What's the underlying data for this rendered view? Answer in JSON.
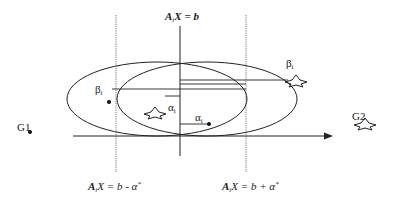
{
  "diagram": {
    "labels": {
      "top_eq": {
        "A": "A",
        "sub": "i",
        "rest": "X = b"
      },
      "left_eq": {
        "A": "A",
        "sub": "i",
        "rest": "X = b - α",
        "sup": "*"
      },
      "right_eq": {
        "A": "A",
        "sub": "i",
        "rest": "X = b + α",
        "sup": "*"
      },
      "beta_left": {
        "sym": "β",
        "sub": "i"
      },
      "beta_right": {
        "sym": "β",
        "sub": "i"
      },
      "alpha_star": {
        "sym": "α",
        "sub": "i"
      },
      "alpha_dot": {
        "sym": "α",
        "sub": "i"
      },
      "g1": "G1",
      "g2": "G2"
    },
    "colors": {
      "line": "#222222",
      "dotted": "#555555",
      "background": "#ffffff"
    }
  }
}
